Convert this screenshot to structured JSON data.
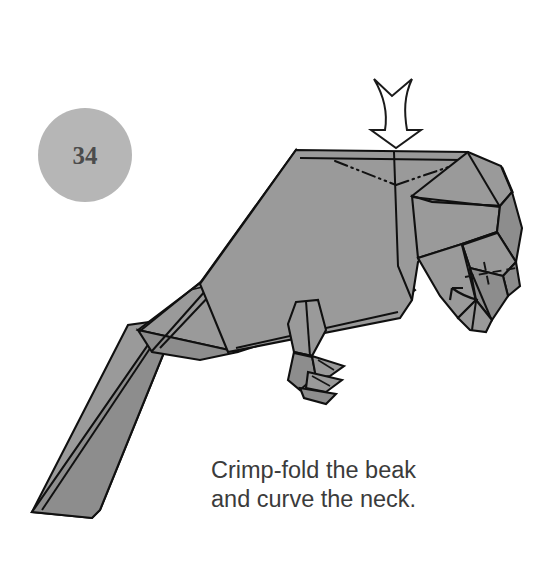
{
  "page": {
    "background_color": "#ffffff",
    "width": 559,
    "height": 575
  },
  "step_badge": {
    "number": "34",
    "fill_color": "#b6b6b6",
    "text_color": "#4c4c4c",
    "center_x": 85,
    "center_y": 155,
    "radius": 47
  },
  "caption": {
    "line1": "Crimp-fold the beak",
    "line2": "and curve the neck.",
    "color": "#3b3b3b"
  },
  "figure": {
    "paper_fill": "#9a9a9a",
    "line_color": "#101010",
    "parts": [
      {
        "name": "tail",
        "label": "tail"
      },
      {
        "name": "wing",
        "label": "wing"
      },
      {
        "name": "body",
        "label": "body"
      },
      {
        "name": "neck",
        "label": "neck"
      },
      {
        "name": "head",
        "label": "head"
      },
      {
        "name": "beak",
        "label": "beak"
      },
      {
        "name": "leg",
        "label": "leg"
      },
      {
        "name": "talons",
        "label": "talons"
      }
    ]
  },
  "annotations": {
    "push_arrow": {
      "name": "push-in-arrow",
      "direction": "down",
      "style": "hollow",
      "target": "neck"
    },
    "beak_arrow": {
      "name": "crimp-fold-arrow",
      "direction": "up-left",
      "style": "solid-curved",
      "target": "beak"
    },
    "mountain_folds": {
      "name": "mountain-fold-line",
      "style": "dash-dot-dot",
      "count": 2,
      "target": "neck"
    },
    "beak_crimp_line": {
      "name": "crimp-fold-line",
      "style": "dashed",
      "target": "beak"
    }
  }
}
